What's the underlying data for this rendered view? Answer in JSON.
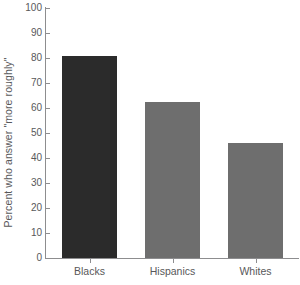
{
  "chart_data": {
    "type": "bar",
    "title": "",
    "subtitle": "",
    "xlabel": "",
    "ylabel": "Percent who answer \"more roughly\"",
    "categories": [
      "Blacks",
      "Hispanics",
      "Whites"
    ],
    "values": [
      81,
      62.5,
      46
    ],
    "series": [
      {
        "name": "Percent who answer \"more roughly\"",
        "values": [
          81,
          62.5,
          46
        ]
      }
    ],
    "ylim": [
      0,
      100
    ],
    "yticks": [
      0,
      10,
      20,
      30,
      40,
      50,
      60,
      70,
      80,
      90,
      100
    ],
    "ytick_labels": [
      "0",
      "10",
      "20",
      "30",
      "40",
      "50",
      "60",
      "70",
      "80",
      "90",
      "100"
    ],
    "grid": false,
    "legend": false,
    "legend_position": "none",
    "bar_colors": [
      "#2b2b2b",
      "#6e6e6e",
      "#6e6e6e"
    ],
    "axis_color": "#8d8d8f",
    "text_color": "#58585a",
    "background_color": "#ffffff",
    "annotations": []
  }
}
